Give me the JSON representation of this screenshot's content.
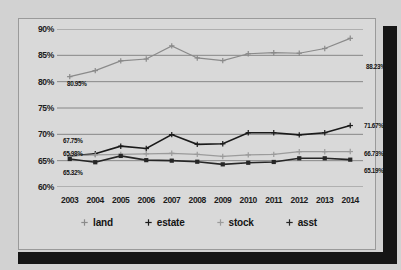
{
  "chart_data": {
    "type": "line",
    "title": "",
    "xlabel": "",
    "ylabel": "",
    "categories": [
      "2003",
      "2004",
      "2005",
      "2006",
      "2007",
      "2008",
      "2009",
      "2010",
      "2011",
      "2012",
      "2013",
      "2014"
    ],
    "ylim": [
      60,
      90
    ],
    "yticks": [
      "60%",
      "65%",
      "70%",
      "75%",
      "80%",
      "85%",
      "90%"
    ],
    "grid": true,
    "legend_position": "bottom",
    "series": [
      {
        "name": "land",
        "color": "#8a8a8a",
        "marker": "plus",
        "values": [
          80.95,
          82.1,
          83.95,
          84.3,
          86.8,
          84.5,
          84.0,
          85.3,
          85.5,
          85.4,
          86.3,
          88.23
        ]
      },
      {
        "name": "estate",
        "color": "#1a1a1a",
        "marker": "plus",
        "values": [
          65.9,
          66.3,
          67.75,
          67.3,
          69.95,
          68.1,
          68.2,
          70.3,
          70.3,
          69.9,
          70.3,
          71.67
        ]
      },
      {
        "name": "stock",
        "color": "#9b9b9b",
        "marker": "plus",
        "values": [
          65.9,
          66.1,
          66.2,
          66.3,
          66.4,
          66.2,
          65.8,
          66.1,
          66.2,
          66.7,
          66.7,
          66.73
        ]
      },
      {
        "name": "asst",
        "color": "#262626",
        "marker": "square",
        "values": [
          65.32,
          64.7,
          65.9,
          65.1,
          65.0,
          64.8,
          64.3,
          64.6,
          64.75,
          65.45,
          65.45,
          65.19
        ]
      }
    ],
    "data_labels": [
      {
        "text": "80.95%",
        "series": "land",
        "category": "2003",
        "x": 48,
        "y": 61
      },
      {
        "text": "88.23%",
        "series": "land",
        "category": "2014",
        "x": 347,
        "y": 44
      },
      {
        "text": "67.75%",
        "series": "estate",
        "category": "2003",
        "x": 44,
        "y": 118
      },
      {
        "text": "71.67%",
        "series": "estate",
        "category": "2014",
        "x": 345,
        "y": 103
      },
      {
        "text": "65.98%",
        "series": "stock",
        "category": "2003",
        "x": 44,
        "y": 131
      },
      {
        "text": "66.73%",
        "series": "stock",
        "category": "2014",
        "x": 345,
        "y": 131
      },
      {
        "text": "65.32%",
        "series": "asst",
        "category": "2003",
        "x": 44,
        "y": 150
      },
      {
        "text": "65.19%",
        "series": "asst",
        "category": "2014",
        "x": 345,
        "y": 148
      }
    ],
    "legend": [
      {
        "label": "land",
        "color": "#8a8a8a",
        "marker": "plus"
      },
      {
        "label": "estate",
        "color": "#1a1a1a",
        "marker": "plus"
      },
      {
        "label": "stock",
        "color": "#9b9b9b",
        "marker": "plus"
      },
      {
        "label": "asst",
        "color": "#262626",
        "marker": "plus"
      }
    ]
  }
}
